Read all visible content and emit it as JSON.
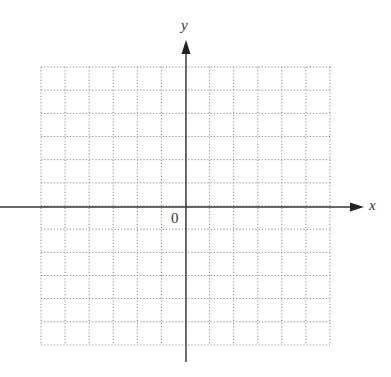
{
  "diagram": {
    "type": "coordinate-plane",
    "axes": {
      "x_label": "x",
      "y_label": "y",
      "origin_label": "0"
    },
    "grid": {
      "columns": 12,
      "rows": 12,
      "columns_left_of_y_axis": 6,
      "rows_above_x_axis": 6,
      "style": "dotted"
    },
    "colors": {
      "grid": "#8a8a8a",
      "axis": "#333333",
      "background": "#ffffff"
    }
  }
}
